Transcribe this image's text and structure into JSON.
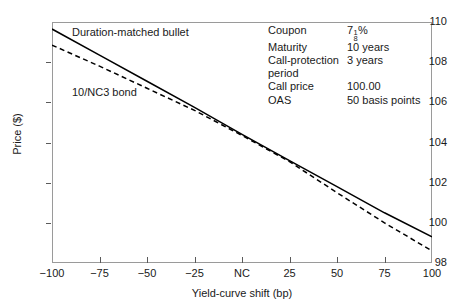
{
  "chart_data": {
    "type": "line",
    "title": "",
    "xlabel": "Yield-curve shift (bp)",
    "ylabel": "Price ($)",
    "xlim": [
      -100,
      100
    ],
    "ylim": [
      98,
      110
    ],
    "xticks": [
      -100,
      -75,
      -50,
      -25,
      0,
      25,
      50,
      75,
      100
    ],
    "xticklabels": [
      "−100",
      "−75",
      "−50",
      "−25",
      "NC",
      "25",
      "50",
      "75",
      "100"
    ],
    "yticks": [
      98,
      100,
      102,
      104,
      106,
      108,
      110
    ],
    "yticklabels": [
      "98",
      "100",
      "102",
      "104",
      "106",
      "108",
      "110"
    ],
    "grid": false,
    "legend": "in-plot annotations",
    "series": [
      {
        "name": "Duration-matched bullet",
        "style": "solid",
        "color": "#000000",
        "x": [
          -100,
          -75,
          -50,
          -25,
          0,
          25,
          50,
          75,
          100
        ],
        "values": [
          109.65,
          108.35,
          107.05,
          105.75,
          104.4,
          103.1,
          101.8,
          100.5,
          99.3
        ]
      },
      {
        "name": "10/NC3 bond",
        "style": "dashed",
        "color": "#000000",
        "x": [
          -100,
          -75,
          -50,
          -25,
          0,
          25,
          50,
          75,
          100
        ],
        "values": [
          108.85,
          107.8,
          106.7,
          105.6,
          104.35,
          103.05,
          101.5,
          100.0,
          98.6
        ]
      }
    ],
    "annotations": [
      {
        "text": "Duration-matched bullet",
        "x": -88,
        "y": 109.4
      },
      {
        "text": "10/NC3 bond",
        "x": -88,
        "y": 106.4
      }
    ]
  },
  "axes": {
    "ylabel": "Price ($)",
    "xlabel": "Yield-curve shift (bp)",
    "yticklabels": [
      "110",
      "108",
      "106",
      "104",
      "102",
      "100",
      "98"
    ],
    "xticklabels": [
      "−100",
      "−75",
      "−50",
      "−25",
      "NC",
      "25",
      "50",
      "75",
      "100"
    ]
  },
  "series_labels": {
    "bullet": "Duration-matched bullet",
    "callable": "10/NC3 bond"
  },
  "params": {
    "rows": [
      {
        "name": "Coupon",
        "value": "7",
        "value_suffix": "%",
        "numerator": "1",
        "denominator": "8",
        "fraction": true
      },
      {
        "name": "Maturity",
        "value": "10 years",
        "fraction": false
      },
      {
        "name": "Call-protection",
        "value": "3 years",
        "fraction": false
      },
      {
        "name": "period",
        "value": "",
        "fraction": false
      },
      {
        "name": "Call price",
        "value": "100.00",
        "fraction": false
      },
      {
        "name": "OAS",
        "value": "50 basis points",
        "fraction": false
      }
    ]
  },
  "colors": {
    "frame": "#9a9a9a",
    "line": "#000000",
    "text": "#1a1a1a",
    "background": "#ffffff"
  }
}
